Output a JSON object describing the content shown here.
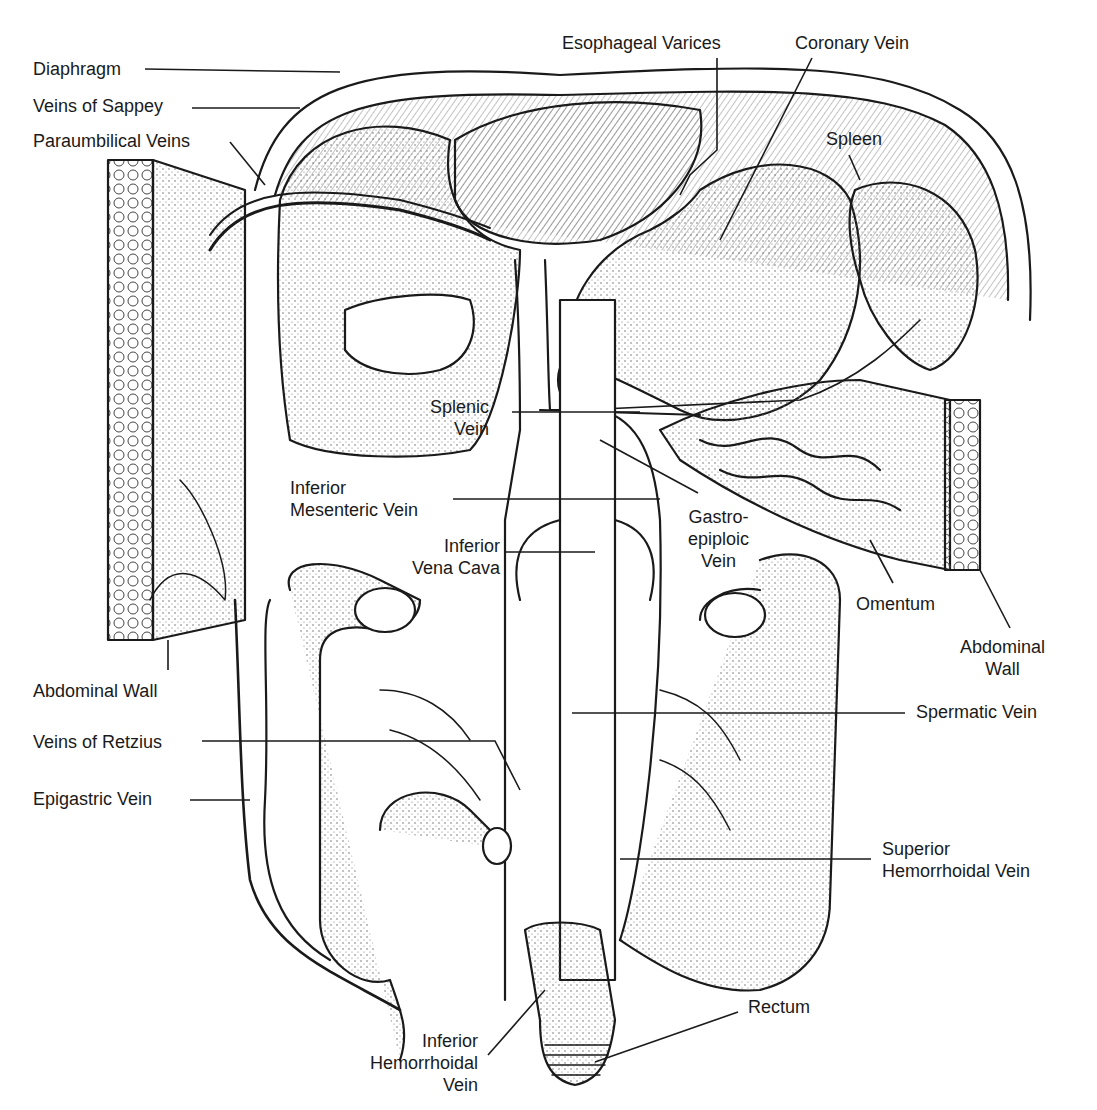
{
  "diagram": {
    "colors": {
      "ink": "#1a1a1a",
      "background": "#ffffff",
      "stipple": "#555555"
    },
    "labels": [
      {
        "id": "diaphragm",
        "lines": [
          "Diaphragm"
        ],
        "x": 33,
        "y": 58,
        "align": "left",
        "leader": [
          [
            145,
            69
          ],
          [
            340,
            72
          ]
        ]
      },
      {
        "id": "veins-of-sappey",
        "lines": [
          "Veins of Sappey"
        ],
        "x": 33,
        "y": 95,
        "align": "left",
        "leader": [
          [
            192,
            108
          ],
          [
            300,
            108
          ]
        ]
      },
      {
        "id": "paraumbilical-veins",
        "lines": [
          "Paraumbilical Veins"
        ],
        "x": 33,
        "y": 130,
        "align": "left",
        "leader": [
          [
            230,
            142
          ],
          [
            265,
            185
          ]
        ]
      },
      {
        "id": "esophageal-varices",
        "lines": [
          "Esophageal Varices"
        ],
        "x": 562,
        "y": 32,
        "align": "left",
        "leader": [
          [
            717,
            58
          ],
          [
            717,
            150
          ],
          [
            690,
            175
          ],
          [
            680,
            195
          ]
        ]
      },
      {
        "id": "coronary-vein",
        "lines": [
          "Coronary Vein"
        ],
        "x": 795,
        "y": 32,
        "align": "left",
        "leader": [
          [
            812,
            58
          ],
          [
            720,
            240
          ]
        ]
      },
      {
        "id": "spleen",
        "lines": [
          "Spleen"
        ],
        "x": 826,
        "y": 128,
        "align": "left",
        "leader": [
          [
            849,
            155
          ],
          [
            860,
            180
          ]
        ]
      },
      {
        "id": "splenic-vein",
        "lines": [
          "Splenic",
          "Vein"
        ],
        "x": 430,
        "y": 396,
        "align": "right",
        "leader": [
          [
            512,
            412
          ],
          [
            640,
            412
          ]
        ]
      },
      {
        "id": "inferior-mesenteric-vein",
        "lines": [
          "Inferior",
          "Mesenteric Vein"
        ],
        "x": 290,
        "y": 477,
        "align": "left",
        "leader": [
          [
            453,
            499
          ],
          [
            660,
            499
          ]
        ]
      },
      {
        "id": "gastro-epiploic-vein",
        "lines": [
          "Gastro-",
          "epiploic",
          "Vein"
        ],
        "x": 688,
        "y": 506,
        "align": "center",
        "leader": [
          [
            698,
            493
          ],
          [
            600,
            440
          ]
        ]
      },
      {
        "id": "inferior-vena-cava",
        "lines": [
          "Inferior",
          "Vena Cava"
        ],
        "x": 412,
        "y": 535,
        "align": "right",
        "leader": [
          [
            505,
            552
          ],
          [
            595,
            552
          ]
        ]
      },
      {
        "id": "omentum",
        "lines": [
          "Omentum"
        ],
        "x": 856,
        "y": 593,
        "align": "left",
        "leader": [
          [
            893,
            583
          ],
          [
            870,
            540
          ]
        ]
      },
      {
        "id": "abdominal-wall-right",
        "lines": [
          "Abdominal",
          "Wall"
        ],
        "x": 960,
        "y": 636,
        "align": "center",
        "leader": [
          [
            1010,
            628
          ],
          [
            980,
            570
          ]
        ]
      },
      {
        "id": "abdominal-wall-left",
        "lines": [
          "Abdominal Wall"
        ],
        "x": 33,
        "y": 680,
        "align": "left",
        "leader": [
          [
            168,
            670
          ],
          [
            168,
            640
          ]
        ]
      },
      {
        "id": "spermatic-vein",
        "lines": [
          "Spermatic Vein"
        ],
        "x": 916,
        "y": 701,
        "align": "left",
        "leader": [
          [
            905,
            713
          ],
          [
            572,
            713
          ]
        ]
      },
      {
        "id": "veins-of-retzius",
        "lines": [
          "Veins of Retzius"
        ],
        "x": 33,
        "y": 731,
        "align": "left",
        "leader": [
          [
            202,
            741
          ],
          [
            495,
            741
          ],
          [
            520,
            790
          ]
        ]
      },
      {
        "id": "epigastric-vein",
        "lines": [
          "Epigastric Vein"
        ],
        "x": 33,
        "y": 788,
        "align": "left",
        "leader": [
          [
            190,
            800
          ],
          [
            250,
            800
          ]
        ]
      },
      {
        "id": "superior-hemorrhoidal-vein",
        "lines": [
          "Superior",
          "Hemorrhoidal Vein"
        ],
        "x": 882,
        "y": 838,
        "align": "left",
        "leader": [
          [
            871,
            859
          ],
          [
            620,
            859
          ]
        ]
      },
      {
        "id": "rectum",
        "lines": [
          "Rectum"
        ],
        "x": 748,
        "y": 996,
        "align": "left",
        "leader": [
          [
            738,
            1012
          ],
          [
            595,
            1062
          ]
        ]
      },
      {
        "id": "inferior-hemorrhoidal-vein",
        "lines": [
          "Inferior",
          "Hemorrhoidal",
          "Vein"
        ],
        "x": 370,
        "y": 1030,
        "align": "right",
        "leader": [
          [
            488,
            1055
          ],
          [
            545,
            990
          ]
        ]
      }
    ]
  }
}
